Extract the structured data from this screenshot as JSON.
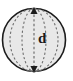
{
  "figure": {
    "name": "sphere-diameter-diagram",
    "shape": "sphere",
    "label": "d",
    "label_meaning": "diameter",
    "colors": {
      "fill": "#e8e8e8",
      "outline": "#1c1c1c",
      "dashed_line": "#6e6e6e",
      "label_text": "#1a1a1a",
      "background": "#ffffff"
    },
    "geometry": {
      "circle_center_x": 34,
      "circle_center_y": 40,
      "circle_radius": 32,
      "longitude_arc_offsets": [
        14,
        0,
        -14
      ],
      "arrow_top_y": 8,
      "arrow_bottom_y": 72
    },
    "icons": {
      "double_headed_arrow": "double-arrow-vertical-icon",
      "dashed_longitude": "dashed-ellipse-arc-icon"
    }
  }
}
